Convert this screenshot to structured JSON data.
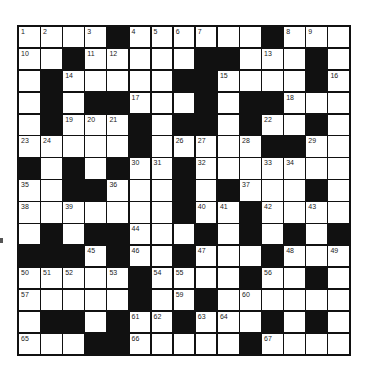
{
  "puzzle": {
    "rows": 15,
    "cols": 15,
    "colors": {
      "block": "#111111",
      "cell": "#ffffff",
      "number": "#222222"
    },
    "grid": [
      "....#......#...",
      "..#.....##...#.",
      ".#.....##....#.",
      ".#.##...#.##...",
      ".#...#.##.#..#.",
      ".....#.....##..",
      "#.#.#..#.......",
      "..##...#.#...#.",
      ".......#..#....",
      ".#.##...#.#.#.#",
      "###.#..#...#...",
      ".....#....#..#.",
      ".....#..#......",
      ".##.#..#...#.#.",
      "...##.....#...."
    ],
    "numbers": [
      {
        "r": 0,
        "c": 0,
        "n": "1"
      },
      {
        "r": 0,
        "c": 1,
        "n": "2"
      },
      {
        "r": 0,
        "c": 3,
        "n": "3"
      },
      {
        "r": 0,
        "c": 5,
        "n": "4"
      },
      {
        "r": 0,
        "c": 6,
        "n": "5"
      },
      {
        "r": 0,
        "c": 7,
        "n": "6"
      },
      {
        "r": 0,
        "c": 8,
        "n": "7"
      },
      {
        "r": 0,
        "c": 12,
        "n": "8"
      },
      {
        "r": 0,
        "c": 13,
        "n": "9"
      },
      {
        "r": 1,
        "c": 0,
        "n": "10"
      },
      {
        "r": 1,
        "c": 3,
        "n": "11"
      },
      {
        "r": 1,
        "c": 4,
        "n": "12"
      },
      {
        "r": 1,
        "c": 11,
        "n": "13"
      },
      {
        "r": 2,
        "c": 2,
        "n": "14"
      },
      {
        "r": 2,
        "c": 9,
        "n": "15"
      },
      {
        "r": 2,
        "c": 14,
        "n": "16"
      },
      {
        "r": 3,
        "c": 5,
        "n": "17"
      },
      {
        "r": 3,
        "c": 12,
        "n": "18"
      },
      {
        "r": 4,
        "c": 2,
        "n": "19"
      },
      {
        "r": 4,
        "c": 3,
        "n": "20"
      },
      {
        "r": 4,
        "c": 4,
        "n": "21"
      },
      {
        "r": 4,
        "c": 11,
        "n": "22"
      },
      {
        "r": 5,
        "c": 0,
        "n": "23"
      },
      {
        "r": 5,
        "c": 1,
        "n": "24"
      },
      {
        "r": 5,
        "c": 5,
        "n": "25"
      },
      {
        "r": 5,
        "c": 7,
        "n": "26"
      },
      {
        "r": 5,
        "c": 8,
        "n": "27"
      },
      {
        "r": 5,
        "c": 10,
        "n": "28"
      },
      {
        "r": 5,
        "c": 13,
        "n": "29"
      },
      {
        "r": 6,
        "c": 5,
        "n": "30"
      },
      {
        "r": 6,
        "c": 6,
        "n": "31"
      },
      {
        "r": 6,
        "c": 8,
        "n": "32"
      },
      {
        "r": 6,
        "c": 11,
        "n": "33"
      },
      {
        "r": 6,
        "c": 12,
        "n": "34"
      },
      {
        "r": 7,
        "c": 0,
        "n": "35"
      },
      {
        "r": 7,
        "c": 4,
        "n": "36"
      },
      {
        "r": 7,
        "c": 10,
        "n": "37"
      },
      {
        "r": 8,
        "c": 0,
        "n": "38"
      },
      {
        "r": 8,
        "c": 2,
        "n": "39"
      },
      {
        "r": 8,
        "c": 8,
        "n": "40"
      },
      {
        "r": 8,
        "c": 9,
        "n": "41"
      },
      {
        "r": 8,
        "c": 11,
        "n": "42"
      },
      {
        "r": 8,
        "c": 13,
        "n": "43"
      },
      {
        "r": 9,
        "c": 5,
        "n": "44"
      },
      {
        "r": 10,
        "c": 3,
        "n": "45"
      },
      {
        "r": 10,
        "c": 5,
        "n": "46"
      },
      {
        "r": 10,
        "c": 8,
        "n": "47"
      },
      {
        "r": 10,
        "c": 12,
        "n": "48"
      },
      {
        "r": 10,
        "c": 14,
        "n": "49"
      },
      {
        "r": 11,
        "c": 0,
        "n": "50"
      },
      {
        "r": 11,
        "c": 1,
        "n": "51"
      },
      {
        "r": 11,
        "c": 2,
        "n": "52"
      },
      {
        "r": 11,
        "c": 4,
        "n": "53"
      },
      {
        "r": 11,
        "c": 6,
        "n": "54"
      },
      {
        "r": 11,
        "c": 7,
        "n": "55"
      },
      {
        "r": 11,
        "c": 11,
        "n": "56"
      },
      {
        "r": 12,
        "c": 0,
        "n": "57"
      },
      {
        "r": 12,
        "c": 5,
        "n": "58"
      },
      {
        "r": 12,
        "c": 7,
        "n": "59"
      },
      {
        "r": 12,
        "c": 10,
        "n": "60"
      },
      {
        "r": 13,
        "c": 5,
        "n": "61"
      },
      {
        "r": 13,
        "c": 6,
        "n": "62"
      },
      {
        "r": 13,
        "c": 8,
        "n": "63"
      },
      {
        "r": 13,
        "c": 9,
        "n": "64"
      },
      {
        "r": 14,
        "c": 0,
        "n": "65"
      },
      {
        "r": 14,
        "c": 5,
        "n": "66"
      },
      {
        "r": 14,
        "c": 11,
        "n": "67"
      }
    ]
  }
}
